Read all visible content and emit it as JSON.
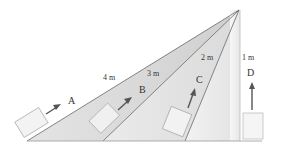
{
  "diagram": {
    "ramps": [
      {
        "id": "A",
        "label": "A",
        "length_label": "4 m"
      },
      {
        "id": "B",
        "label": "B",
        "length_label": "3 m"
      },
      {
        "id": "C",
        "label": "C",
        "length_label": "2 m"
      },
      {
        "id": "D",
        "label": "D",
        "length_label": "1 m"
      }
    ],
    "colors": {
      "ramp_a": "#d6d6d6",
      "ramp_b": "#e2e2e2",
      "ramp_c": "#ececec",
      "ramp_d": "#f4f4f4",
      "line": "#666666",
      "arrow": "#555555",
      "box": "#f2f2f2"
    }
  }
}
